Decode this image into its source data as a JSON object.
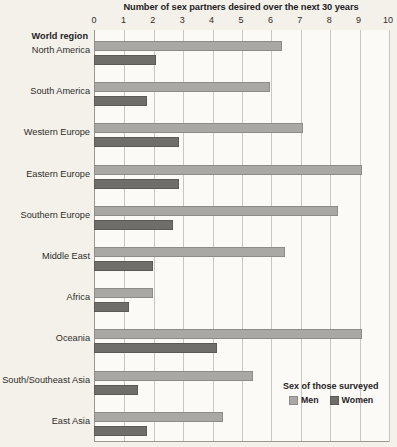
{
  "chart_data": {
    "type": "bar",
    "orientation": "horizontal",
    "title": "Number of sex partners desired over the next 30 years",
    "xlabel": "",
    "ylabel": "World region",
    "xlim": [
      0,
      10
    ],
    "xticks": [
      0,
      1,
      2,
      3,
      4,
      5,
      6,
      7,
      8,
      9,
      10
    ],
    "xtick_labels": [
      "0",
      "1",
      "2",
      "3",
      "4",
      "5",
      "6",
      "7",
      "8",
      "9",
      "10"
    ],
    "grid": true,
    "legend": {
      "title": "Sex of those surveyed",
      "position": "bottom-right",
      "entries": [
        {
          "name": "Men",
          "color": "#a9a8a4"
        },
        {
          "name": "Women",
          "color": "#6f6e6b"
        }
      ]
    },
    "categories": [
      "North America",
      "South America",
      "Western Europe",
      "Eastern Europe",
      "Southern Europe",
      "Middle East",
      "Africa",
      "Oceania",
      "South/Southeast Asia",
      "East Asia"
    ],
    "series": [
      {
        "name": "Men",
        "color": "#a9a8a4",
        "values": [
          6.4,
          6.0,
          7.1,
          9.1,
          8.3,
          6.5,
          2.0,
          9.1,
          5.4,
          4.4
        ]
      },
      {
        "name": "Women",
        "color": "#6f6e6b",
        "values": [
          2.1,
          1.8,
          2.9,
          2.9,
          2.7,
          2.0,
          1.2,
          4.2,
          1.5,
          1.8
        ]
      }
    ]
  },
  "colors": {
    "background": "#f3f1ea",
    "plot_background": "#fbfaf7",
    "gridline": "#c9c6bf",
    "axis": "#9b9892",
    "text": "#2f2d2a",
    "men": "#a9a8a4",
    "women": "#6f6e6b"
  }
}
